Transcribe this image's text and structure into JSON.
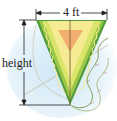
{
  "diagram": {
    "labels": {
      "width": "4 ft",
      "height": "height"
    },
    "colors": {
      "sky": "#d6ecf7",
      "kite_outer": "#4f9a3a",
      "kite_mid": "#c7dd5a",
      "kite_inner": "#f4e58a",
      "kite_center": "#f2a86a",
      "string": "#8a9a5a",
      "dimension_line": "#222222"
    }
  }
}
